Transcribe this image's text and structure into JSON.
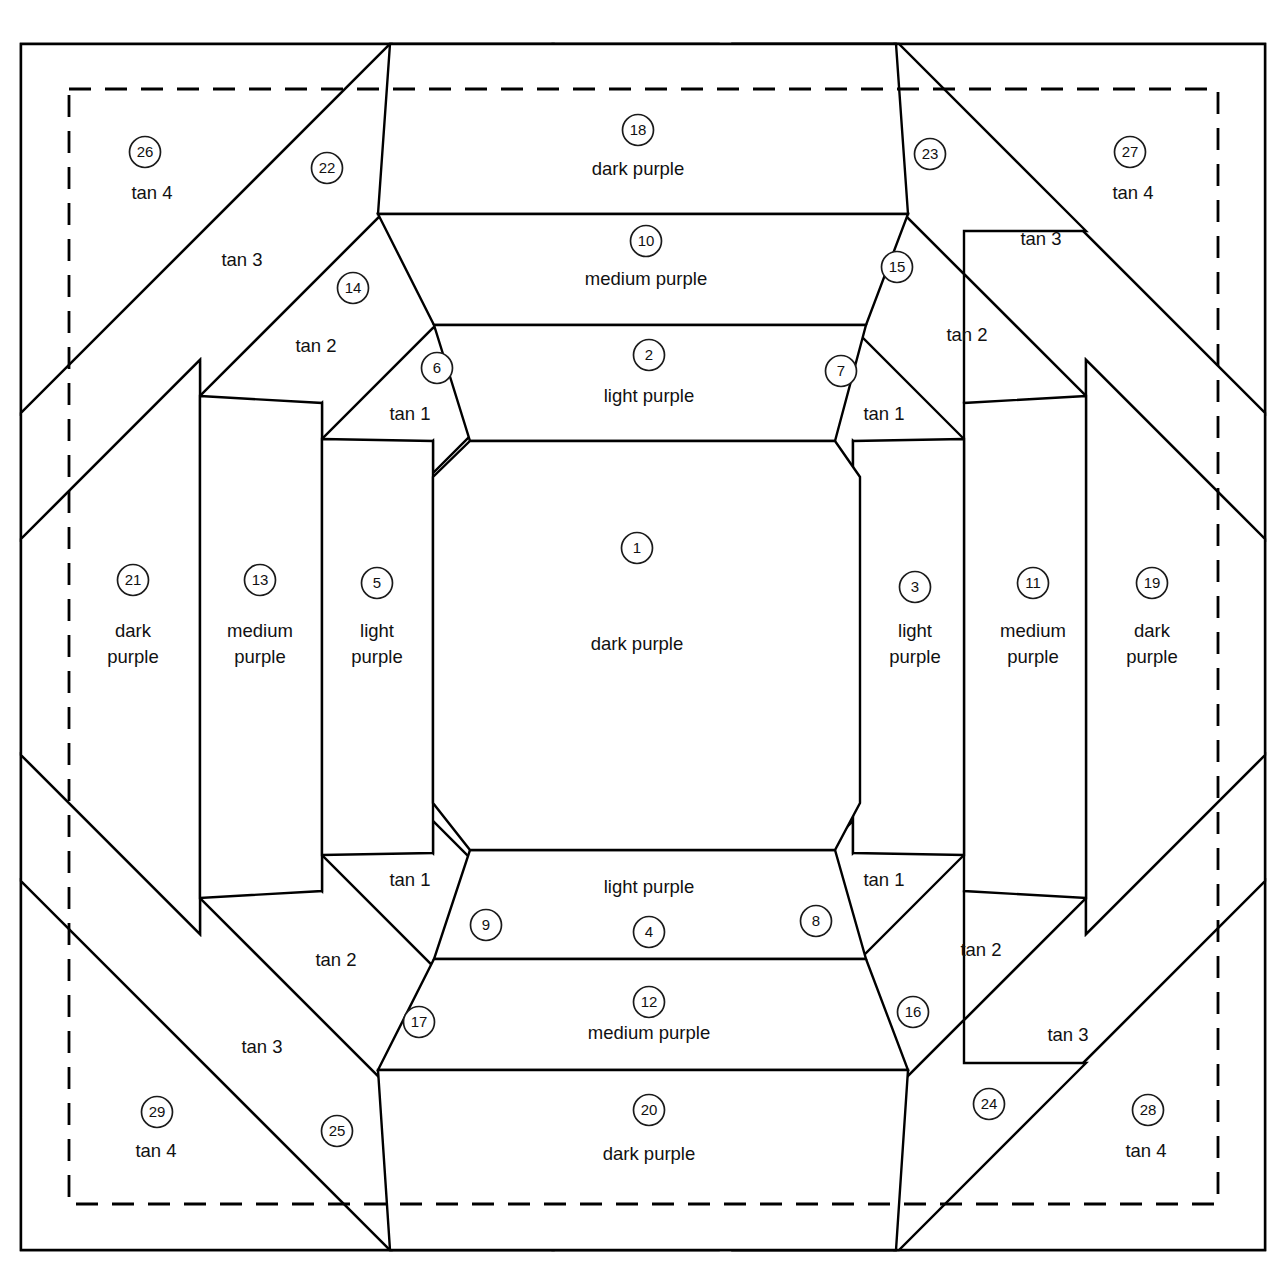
{
  "diagram": {
    "frame": {
      "outer_border_name": "solid-cutting-line",
      "inner_border_name": "dashed-seam-line",
      "line_color": "#000000",
      "background_color": "#ffffff"
    },
    "fabric_names": {
      "dark_purple": "dark purple",
      "medium_purple": "medium purple",
      "light_purple": "light purple",
      "tan1": "tan 1",
      "tan2": "tan 2",
      "tan3": "tan 3",
      "tan4": "tan 4"
    },
    "pieces": [
      {
        "n": "1",
        "fabric": "dark purple",
        "label_lines": [
          "dark purple"
        ],
        "nx": 637,
        "ny": 548,
        "tx": 637,
        "ty": 645
      },
      {
        "n": "2",
        "fabric": "light purple",
        "label_lines": [
          "light purple"
        ],
        "nx": 649,
        "ny": 355,
        "tx": 649,
        "ty": 397
      },
      {
        "n": "3",
        "fabric": "light purple",
        "label_lines": [
          "light",
          "purple"
        ],
        "nx": 915,
        "ny": 587,
        "tx": 915,
        "ty": 645
      },
      {
        "n": "4",
        "fabric": "light purple",
        "label_lines": [
          "light purple"
        ],
        "nx": 649,
        "ny": 932,
        "tx": 649,
        "ty": 888
      },
      {
        "n": "5",
        "fabric": "light purple",
        "label_lines": [
          "light",
          "purple"
        ],
        "nx": 377,
        "ny": 583,
        "tx": 377,
        "ty": 645
      },
      {
        "n": "6",
        "fabric": "tan 1",
        "label_lines": [
          "tan 1"
        ],
        "nx": 437,
        "ny": 368,
        "tx": 410,
        "ty": 415
      },
      {
        "n": "7",
        "fabric": "tan 1",
        "label_lines": [
          "tan 1"
        ],
        "nx": 841,
        "ny": 371,
        "tx": 884,
        "ty": 415
      },
      {
        "n": "8",
        "fabric": "tan 1",
        "label_lines": [
          "tan 1"
        ],
        "nx": 816,
        "ny": 921,
        "tx": 884,
        "ty": 881
      },
      {
        "n": "9",
        "fabric": "tan 1",
        "label_lines": [
          "tan 1"
        ],
        "nx": 486,
        "ny": 925,
        "tx": 410,
        "ty": 881
      },
      {
        "n": "10",
        "fabric": "medium purple",
        "label_lines": [
          "medium purple"
        ],
        "nx": 646,
        "ny": 241,
        "tx": 646,
        "ty": 280
      },
      {
        "n": "11",
        "fabric": "medium purple",
        "label_lines": [
          "medium",
          "purple"
        ],
        "nx": 1033,
        "ny": 583,
        "tx": 1033,
        "ty": 645
      },
      {
        "n": "12",
        "fabric": "medium purple",
        "label_lines": [
          "medium purple"
        ],
        "nx": 649,
        "ny": 1002,
        "tx": 649,
        "ty": 1034
      },
      {
        "n": "13",
        "fabric": "medium purple",
        "label_lines": [
          "medium",
          "purple"
        ],
        "nx": 260,
        "ny": 580,
        "tx": 260,
        "ty": 645
      },
      {
        "n": "14",
        "fabric": "tan 2",
        "label_lines": [
          "tan 2"
        ],
        "nx": 353,
        "ny": 288,
        "tx": 316,
        "ty": 347
      },
      {
        "n": "15",
        "fabric": "tan 2",
        "label_lines": [
          "tan 2"
        ],
        "nx": 897,
        "ny": 267,
        "tx": 967,
        "ty": 336
      },
      {
        "n": "16",
        "fabric": "tan 2",
        "label_lines": [
          "tan 2"
        ],
        "nx": 913,
        "ny": 1012,
        "tx": 981,
        "ty": 951
      },
      {
        "n": "17",
        "fabric": "tan 2",
        "label_lines": [
          "tan 2"
        ],
        "nx": 419,
        "ny": 1022,
        "tx": 336,
        "ty": 961
      },
      {
        "n": "18",
        "fabric": "dark purple",
        "label_lines": [
          "dark purple"
        ],
        "nx": 638,
        "ny": 130,
        "tx": 638,
        "ty": 170
      },
      {
        "n": "19",
        "fabric": "dark purple",
        "label_lines": [
          "dark",
          "purple"
        ],
        "nx": 1152,
        "ny": 583,
        "tx": 1152,
        "ty": 645
      },
      {
        "n": "20",
        "fabric": "dark purple",
        "label_lines": [
          "dark purple"
        ],
        "nx": 649,
        "ny": 1110,
        "tx": 649,
        "ty": 1155
      },
      {
        "n": "21",
        "fabric": "dark purple",
        "label_lines": [
          "dark",
          "purple"
        ],
        "nx": 133,
        "ny": 580,
        "tx": 133,
        "ty": 645
      },
      {
        "n": "22",
        "fabric": "tan 3",
        "label_lines": [
          "tan 3"
        ],
        "nx": 327,
        "ny": 168,
        "tx": 242,
        "ty": 261
      },
      {
        "n": "23",
        "fabric": "tan 3",
        "label_lines": [
          "tan 3"
        ],
        "nx": 930,
        "ny": 154,
        "tx": 1041,
        "ty": 240
      },
      {
        "n": "24",
        "fabric": "tan 3",
        "label_lines": [
          "tan 3"
        ],
        "nx": 989,
        "ny": 1104,
        "tx": 1068,
        "ty": 1036
      },
      {
        "n": "25",
        "fabric": "tan 3",
        "label_lines": [
          "tan 3"
        ],
        "nx": 337,
        "ny": 1131,
        "tx": 262,
        "ty": 1048
      },
      {
        "n": "26",
        "fabric": "tan 4",
        "label_lines": [
          "tan 4"
        ],
        "nx": 145,
        "ny": 152,
        "tx": 152,
        "ty": 194
      },
      {
        "n": "27",
        "fabric": "tan 4",
        "label_lines": [
          "tan 4"
        ],
        "nx": 1130,
        "ny": 152,
        "tx": 1133,
        "ty": 194
      },
      {
        "n": "28",
        "fabric": "tan 4",
        "label_lines": [
          "tan 4"
        ],
        "nx": 1148,
        "ny": 1110,
        "tx": 1146,
        "ty": 1152
      },
      {
        "n": "29",
        "fabric": "tan 4",
        "label_lines": [
          "tan 4"
        ],
        "nx": 157,
        "ny": 1112,
        "tx": 156,
        "ty": 1152
      }
    ]
  }
}
